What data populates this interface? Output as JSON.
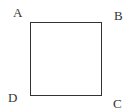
{
  "diagram": {
    "type": "square",
    "vertices": [
      {
        "label": "A",
        "position": "top-left"
      },
      {
        "label": "B",
        "position": "top-right"
      },
      {
        "label": "C",
        "position": "bottom-right"
      },
      {
        "label": "D",
        "position": "bottom-left"
      }
    ],
    "stroke_color": "#333333",
    "background": "#ffffff"
  }
}
